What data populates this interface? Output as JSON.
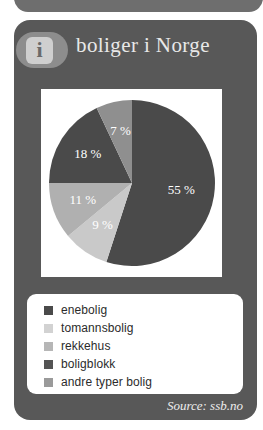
{
  "card": {
    "title": "boliger i Norge",
    "info_icon_glyph": "i",
    "source": "Source: ssb.no",
    "background_color": "#585858",
    "panel_color": "#ffffff"
  },
  "chart_data": {
    "type": "pie",
    "title": "boliger i Norge",
    "categories": [
      "enebolig",
      "tomannsbolig",
      "rekkehus",
      "boligblokk",
      "andre typer bolig"
    ],
    "values": [
      55,
      9,
      11,
      18,
      7
    ],
    "labels": [
      "55 %",
      "9 %",
      "11 %",
      "18 %",
      "7 %"
    ],
    "colors": [
      "#4a4a4a",
      "#c9c9c9",
      "#b0b0b0",
      "#4a4a4a",
      "#8f8f8f"
    ],
    "unit": "%",
    "legend_position": "bottom",
    "start_angle_deg": 0,
    "direction": "clockwise",
    "source": "Source: ssb.no",
    "slices": [
      {
        "name": "enebolig",
        "value": 55,
        "label": "55 %",
        "color": "#4a4a4a"
      },
      {
        "name": "tomannsbolig",
        "value": 9,
        "label": "9 %",
        "color": "#c9c9c9"
      },
      {
        "name": "rekkehus",
        "value": 11,
        "label": "11 %",
        "color": "#b0b0b0"
      },
      {
        "name": "boligblokk",
        "value": 18,
        "label": "18 %",
        "color": "#4a4a4a"
      },
      {
        "name": "andre typer bolig",
        "value": 7,
        "label": "7 %",
        "color": "#8f8f8f"
      }
    ]
  },
  "legend": {
    "items": [
      {
        "label": "enebolig",
        "color": "#4a4a4a"
      },
      {
        "label": "tomannsbolig",
        "color": "#d2d2d2"
      },
      {
        "label": "rekkehus",
        "color": "#b6b6b6"
      },
      {
        "label": "boligblokk",
        "color": "#545454"
      },
      {
        "label": "andre typer bolig",
        "color": "#9a9a9a"
      }
    ]
  }
}
